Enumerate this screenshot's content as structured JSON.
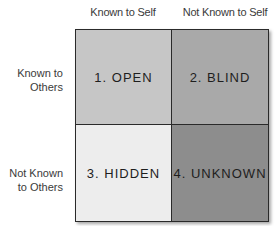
{
  "columns": [
    "Known to Self",
    "Not Known to Self"
  ],
  "rows": [
    {
      "line1": "Known to",
      "line2": "Others"
    },
    {
      "line1": "Not Known",
      "line2": "to Others"
    }
  ],
  "quadrants": [
    {
      "label": "1. OPEN",
      "color": "#c6c6c6"
    },
    {
      "label": "2. BLIND",
      "color": "#a9a9a9"
    },
    {
      "label": "3. HIDDEN",
      "color": "#ededed"
    },
    {
      "label": "4. UNKNOWN",
      "color": "#8d8d8d"
    }
  ]
}
